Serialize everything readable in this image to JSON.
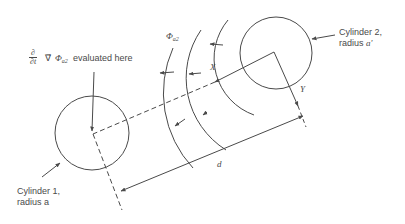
{
  "diagram": {
    "type": "two-cylinder field geometry",
    "colors": {
      "stroke": "#4a4a4a",
      "text": "#4a4a4a",
      "background": "#ffffff"
    },
    "labels": {
      "eval_expr_frac_num": "∂",
      "eval_expr_frac_den": "∂t",
      "eval_expr_grad": "∇⃗",
      "eval_expr_phi": "Φ",
      "eval_expr_phi_sub": "a2",
      "eval_text": "evaluated here",
      "phi_label": "Φ",
      "phi_label_sub": "a2",
      "x_axis": "X",
      "y_axis": "Y",
      "distance": "d",
      "cylinder2_line1": "Cylinder 2,",
      "cylinder2_line2_prefix": "radius ",
      "cylinder2_line2_var": "a'",
      "cylinder1_line1": "Cylinder 1,",
      "cylinder1_line2_prefix": "radius ",
      "cylinder1_line2_var": "a"
    },
    "shapes": {
      "cylinder1": {
        "cx": 92,
        "cy": 133,
        "r": 37
      },
      "cylinder2": {
        "cx": 276,
        "cy": 53,
        "r": 36
      },
      "wavefront_arcs": 3
    }
  }
}
